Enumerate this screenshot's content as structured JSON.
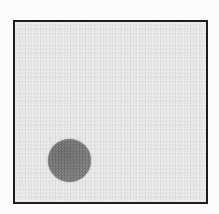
{
  "figure": {
    "kind": "scanned-figure",
    "background_color": "#fdfdfd",
    "frame": {
      "border_color": "#1d1d1d",
      "border_width_px": 2.5,
      "fill_color": "#efefef",
      "x_px": 13,
      "y_px": 20,
      "width_px": 195,
      "height_px": 184
    },
    "shapes": [
      {
        "name": "filled-circle",
        "type": "circle",
        "fill_color": "#7f7f7f",
        "center_x_px": 67,
        "center_y_px": 158,
        "diameter_px": 43
      }
    ],
    "labels": [],
    "caption": ""
  }
}
